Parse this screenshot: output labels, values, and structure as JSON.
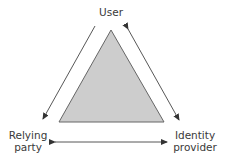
{
  "diagram": {
    "nodes": {
      "user": {
        "label": "User"
      },
      "relying_party": {
        "line1": "Relying",
        "line2": "party"
      },
      "identity_provider": {
        "line1": "Identity",
        "line2": "provider"
      }
    },
    "edges": [
      {
        "from": "User",
        "to": "Relying party",
        "direction": "one-way"
      },
      {
        "from": "User",
        "to": "Identity provider",
        "direction": "two-way"
      },
      {
        "from": "Relying party",
        "to": "Identity provider",
        "direction": "two-way"
      }
    ],
    "colors": {
      "triangle_fill": "#cdcdcd",
      "stroke": "#444444",
      "text": "#3a3a3a"
    }
  }
}
